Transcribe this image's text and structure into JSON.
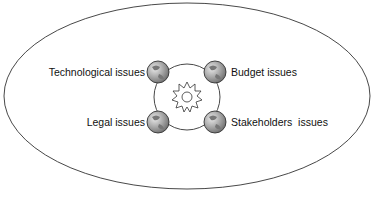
{
  "diagram": {
    "labels": {
      "top_left": "Technological issues",
      "top_right": "Budget issues",
      "bottom_left": "Legal issues",
      "bottom_right": "Stakeholders  issues"
    },
    "center_icon": "sun-icon",
    "node_icon": "globe-icon",
    "colors": {
      "stroke": "#333333",
      "globe_fill": "#9a9a9a",
      "globe_highlight": "#e0e0e0",
      "background": "#ffffff"
    }
  }
}
